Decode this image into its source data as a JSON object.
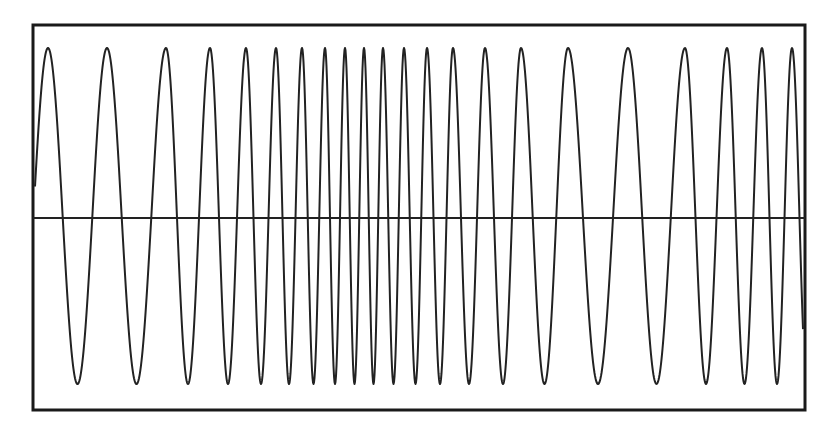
{
  "chart_data": {
    "type": "line",
    "title": "",
    "xlabel": "",
    "ylabel": "",
    "grid": false,
    "legend": null,
    "axis_line": "horizontal zero line across the plot",
    "ylim": [
      -1,
      1
    ],
    "peak_x_pixels": [
      48,
      107,
      166,
      210,
      246,
      276,
      302,
      325,
      345,
      364,
      383,
      404,
      427,
      453,
      485,
      521,
      568,
      628,
      685,
      727,
      762,
      792
    ],
    "peak_count": 22,
    "amplitude": 1,
    "series": [
      {
        "name": "signal",
        "color": "#222222"
      }
    ]
  },
  "frame": {
    "left": 33,
    "top": 25,
    "right": 805,
    "bottom": 410,
    "zero_y": 218,
    "peak_y": 48,
    "trough_y": 384,
    "border_color": "#1a1a1a",
    "line_color": "#222222"
  }
}
